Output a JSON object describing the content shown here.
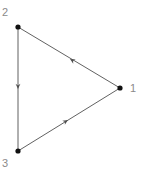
{
  "figure": {
    "kind": "directed-graph",
    "background_color": "#ffffff",
    "width": 144,
    "height": 177
  },
  "graph": {
    "node_color": "#111111",
    "node_radius": 2.6,
    "edge_color": "#4f4f4f",
    "edge_width": 0.9,
    "arrow_color": "#4f4f4f",
    "label_color": "#8a8a8a",
    "label_font_size": 11,
    "nodes": [
      {
        "id": "1",
        "label": "1",
        "x": 120,
        "y": 88,
        "label_x": 130,
        "label_y": 83
      },
      {
        "id": "2",
        "label": "2",
        "x": 18,
        "y": 27,
        "label_x": 2,
        "label_y": 7
      },
      {
        "id": "3",
        "label": "3",
        "x": 18,
        "y": 151,
        "label_x": 2,
        "label_y": 158
      }
    ],
    "edges": [
      {
        "id": "edge-1-2",
        "source": "1",
        "target": "2",
        "x1": 120,
        "y1": 88,
        "x2": 18,
        "y2": 27,
        "arrow_x": 70,
        "arrow_y": 59,
        "arrow_angle": -149.1
      },
      {
        "id": "edge-2-3",
        "source": "2",
        "target": "3",
        "x1": 18,
        "y1": 27,
        "x2": 18,
        "y2": 151,
        "arrow_x": 18,
        "arrow_y": 89,
        "arrow_angle": 90
      },
      {
        "id": "edge-3-1",
        "source": "3",
        "target": "1",
        "x1": 18,
        "y1": 151,
        "x2": 120,
        "y2": 88,
        "arrow_x": 68,
        "arrow_y": 120,
        "arrow_angle": -31.7
      }
    ]
  }
}
